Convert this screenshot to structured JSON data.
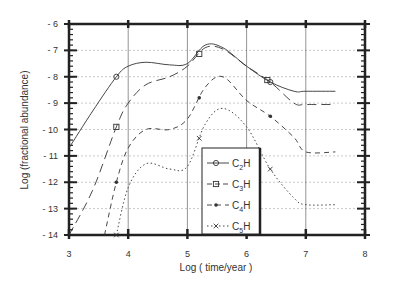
{
  "chart_data": {
    "type": "line",
    "title": "",
    "xlabel": "Log ( time/year )",
    "ylabel": "Log (fractional abundance)",
    "xlim": [
      3,
      8
    ],
    "ylim": [
      -14,
      -6
    ],
    "xticks": [
      "3",
      "4",
      "5",
      "6",
      "7",
      "8"
    ],
    "yticks": [
      "-6",
      "-7",
      "-8",
      "-9",
      "-10",
      "-11",
      "-12",
      "-13",
      "-14"
    ],
    "grid": true,
    "legend_position": "lower center",
    "series": [
      {
        "name": "C2H",
        "style": "solid",
        "marker": "circle",
        "x": [
          3.0,
          3.4,
          3.8,
          4.0,
          4.3,
          4.7,
          5.0,
          5.3,
          5.6,
          6.0,
          6.4,
          6.8,
          7.0,
          7.5
        ],
        "y": [
          -10.7,
          -9.3,
          -8.0,
          -7.6,
          -7.45,
          -7.55,
          -7.5,
          -6.8,
          -6.9,
          -7.6,
          -8.2,
          -8.55,
          -8.55,
          -8.55
        ]
      },
      {
        "name": "C3H",
        "style": "long-dash",
        "marker": "square",
        "x": [
          3.0,
          3.4,
          3.8,
          4.0,
          4.3,
          4.7,
          5.0,
          5.3,
          5.6,
          6.0,
          6.4,
          6.8,
          7.0,
          7.5
        ],
        "y": [
          -14.0,
          -12.3,
          -9.9,
          -9.0,
          -8.3,
          -8.0,
          -7.6,
          -6.9,
          -6.95,
          -7.6,
          -8.2,
          -9.0,
          -9.05,
          -9.05
        ]
      },
      {
        "name": "C4H",
        "style": "dash",
        "marker": "diamond",
        "x": [
          3.6,
          3.8,
          4.0,
          4.3,
          4.7,
          5.0,
          5.3,
          5.6,
          6.0,
          6.4,
          6.8,
          7.0,
          7.5
        ],
        "y": [
          -14.0,
          -12.0,
          -10.7,
          -10.0,
          -10.0,
          -9.6,
          -8.4,
          -8.0,
          -8.9,
          -9.5,
          -10.3,
          -10.85,
          -10.85
        ]
      },
      {
        "name": "C5H",
        "style": "dotted",
        "marker": "x",
        "x": [
          3.8,
          4.0,
          4.3,
          4.7,
          5.0,
          5.3,
          5.6,
          6.0,
          6.4,
          6.8,
          7.0,
          7.5
        ],
        "y": [
          -14.0,
          -12.2,
          -11.3,
          -11.5,
          -11.4,
          -9.8,
          -9.2,
          -9.9,
          -11.5,
          -12.6,
          -12.85,
          -12.85
        ]
      }
    ],
    "legend": [
      {
        "label": "C",
        "sub": "2",
        "tail": "H"
      },
      {
        "label": "C",
        "sub": "3",
        "tail": "H"
      },
      {
        "label": "C",
        "sub": "4",
        "tail": "H"
      },
      {
        "label": "C",
        "sub": "5",
        "tail": "H"
      }
    ]
  }
}
